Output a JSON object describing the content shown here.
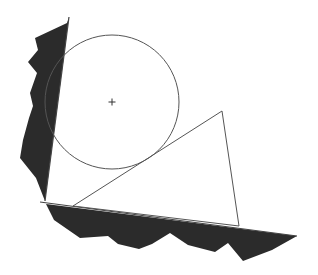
{
  "canvas": {
    "width": 318,
    "height": 275,
    "background": "#ffffff"
  },
  "colors": {
    "ground": "#2b2b2b",
    "stroke": "#555555",
    "edge": "#444444"
  },
  "wall": {
    "line": {
      "x1": 69,
      "y1": 17,
      "x2": 45,
      "y2": 201
    },
    "hatch": [
      [
        67,
        23
      ],
      [
        35,
        38
      ],
      [
        38,
        50
      ],
      [
        28,
        62
      ],
      [
        37,
        73
      ],
      [
        30,
        93
      ],
      [
        33,
        106
      ],
      [
        29,
        118
      ],
      [
        23,
        140
      ],
      [
        20,
        158
      ],
      [
        36,
        178
      ],
      [
        43,
        196
      ],
      [
        45,
        201
      ]
    ]
  },
  "floor": {
    "line": {
      "x1": 40,
      "y1": 202,
      "x2": 297,
      "y2": 236
    },
    "hatch": [
      [
        46,
        204
      ],
      [
        54,
        220
      ],
      [
        80,
        238
      ],
      [
        108,
        236
      ],
      [
        118,
        244
      ],
      [
        139,
        249
      ],
      [
        152,
        244
      ],
      [
        170,
        233
      ],
      [
        188,
        245
      ],
      [
        215,
        252
      ],
      [
        228,
        243
      ],
      [
        243,
        261
      ],
      [
        272,
        250
      ],
      [
        297,
        236
      ]
    ]
  },
  "circle": {
    "cx": 112,
    "cy": 102,
    "r": 67,
    "center_marker": "+"
  },
  "triangle": {
    "points": [
      [
        73,
        206
      ],
      [
        222,
        111
      ],
      [
        239,
        226
      ]
    ]
  }
}
